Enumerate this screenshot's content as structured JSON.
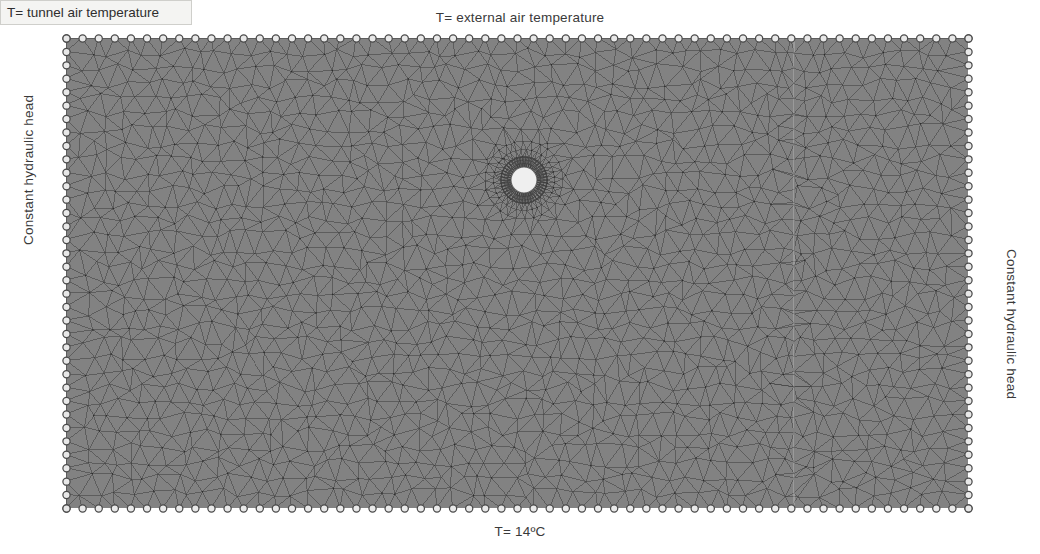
{
  "figure": {
    "type": "finite-element-mesh-diagram",
    "background_color": "#ffffff",
    "mesh_fill_color": "#828282",
    "mesh_edge_color": "#3c3c3c",
    "label_text_color": "#3a3a3a"
  },
  "labels": {
    "top": "T= external air temperature",
    "bottom": "T= 14ºC",
    "left": "Constant hydraulic head",
    "right": "Constant hydraulic head",
    "tunnel": "T= tunnel air temperature"
  },
  "domain": {
    "x": 66,
    "y": 38,
    "width": 902,
    "height": 470,
    "internal_boundary_x": 794,
    "internal_boundary_label": "vertical-interface-line"
  },
  "tunnel": {
    "center_x": 524,
    "center_y": 180,
    "outer_radius": 23,
    "inner_radius": 13,
    "lining_ring_color": "#5a5a5a",
    "void_color": "#efefef"
  },
  "boundary_markers": {
    "icon": "circle-marker",
    "glyph_name": "boundary-condition-circle-icon",
    "diameter": 9,
    "color": "#e8e8e8",
    "stroke": "#4a4a4a",
    "top_spacing": 16,
    "bottom_spacing": 16,
    "left_spacing": 13.5,
    "right_spacing": 13.5
  },
  "chart_data": {
    "type": "heatmap",
    "xlabel": "",
    "ylabel": "",
    "annotations": [
      "T= external air temperature",
      "T= 14ºC",
      "Constant hydraulic head",
      "Constant hydraulic head",
      "T= tunnel air temperature"
    ]
  }
}
